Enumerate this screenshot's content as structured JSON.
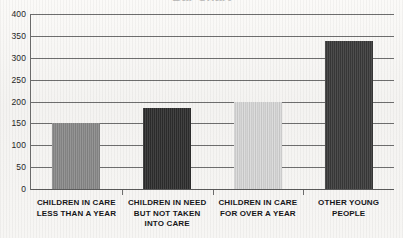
{
  "title_sliver": {
    "text": "Bar Chart"
  },
  "chart_data": {
    "type": "bar",
    "title": "",
    "xlabel": "",
    "ylabel": "",
    "ylim": [
      0,
      400
    ],
    "y_ticks": [
      0,
      50,
      100,
      150,
      200,
      250,
      300,
      350,
      400
    ],
    "y_tick_labels": [
      "0",
      "50",
      "100",
      "150",
      "200",
      "250",
      "300",
      "350",
      "400"
    ],
    "grid": true,
    "legend": "none",
    "categories": [
      "CHILDREN IN CARE LESS THAN A YEAR",
      "CHILDREN IN NEED BUT NOT TAKEN INTO CARE",
      "CHILDREN IN CARE FOR OVER A YEAR",
      "OTHER YOUNG PEOPLE"
    ],
    "category_label_lines": [
      [
        "CHILDREN IN CARE",
        "LESS THAN A YEAR"
      ],
      [
        "CHILDREN IN NEED",
        "BUT NOT TAKEN",
        "INTO CARE"
      ],
      [
        "CHILDREN IN CARE",
        "FOR OVER A YEAR"
      ],
      [
        "OTHER YOUNG",
        "PEOPLE"
      ]
    ],
    "values": [
      150,
      185,
      200,
      338
    ],
    "bar_colors": [
      "#8a8a8a",
      "#2e2e2e",
      "#d8d8d8",
      "#3a3a3a"
    ]
  },
  "colors": {
    "background": "#f7f6f4",
    "axis": "#6e6e6e",
    "text": "#17171a",
    "tick_text": "#262626"
  }
}
